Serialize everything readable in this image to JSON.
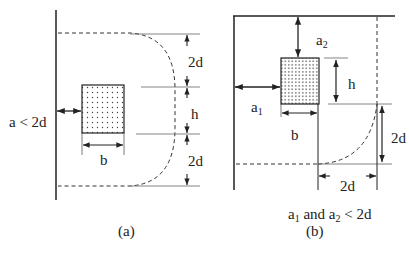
{
  "figure": {
    "panel_a": {
      "caption": "(a)",
      "condition": "a < 2d",
      "labels": {
        "top_offset": "2d",
        "height": "h",
        "bottom_offset": "2d",
        "width": "b"
      }
    },
    "panel_b": {
      "caption": "(b)",
      "condition_parts": {
        "a": "a",
        "sub1": "1",
        "and_a": " and a",
        "sub2": "2",
        "rest": " < 2d"
      },
      "labels": {
        "a1": "a",
        "a1_sub": "1",
        "a2": "a",
        "a2_sub": "2",
        "height": "h",
        "width": "b",
        "vertical_offset": "2d",
        "horizontal_offset": "2d"
      }
    },
    "colors": {
      "line": "#222222",
      "thin_line": "#555555",
      "fill_dots": "#444444"
    }
  }
}
